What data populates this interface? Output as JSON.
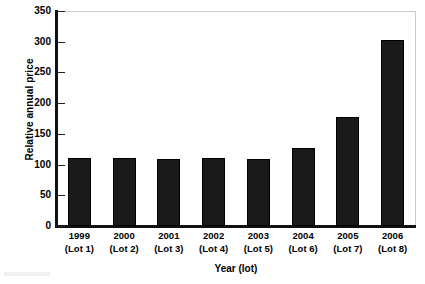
{
  "chart_data": {
    "type": "bar",
    "title": "",
    "xlabel": "Year (lot)",
    "ylabel": "Relative annual price",
    "categories": [
      "1999\n(Lot 1)",
      "2000\n(Lot 2)",
      "2001\n(Lot 3)",
      "2002\n(Lot 4)",
      "2003\n(Lot 5)",
      "2004\n(Lot 6)",
      "2005\n(Lot 7)",
      "2006\n(Lot 8)"
    ],
    "category_years": [
      "1999",
      "2000",
      "2001",
      "2002",
      "2003",
      "2004",
      "2005",
      "2006"
    ],
    "category_lots": [
      "(Lot 1)",
      "(Lot 2)",
      "(Lot 3)",
      "(Lot 4)",
      "(Lot 5)",
      "(Lot 6)",
      "(Lot 7)",
      "(Lot 8)"
    ],
    "values": [
      111,
      110,
      109,
      111,
      109,
      127,
      177,
      303
    ],
    "ylim": [
      0,
      350
    ],
    "ytick_values": [
      0,
      50,
      100,
      150,
      200,
      250,
      300,
      350
    ],
    "ytick_labels": [
      "0",
      "50",
      "100",
      "150",
      "200",
      "250",
      "300",
      "350"
    ],
    "grid": false,
    "legend": false,
    "bar_color": "#1a1a1a",
    "axis_color": "#111111",
    "frame_color": "#c9c9c9",
    "background": "#ffffff"
  },
  "axes": {
    "y_title": "Relative annual price",
    "x_title": "Year (lot)"
  }
}
